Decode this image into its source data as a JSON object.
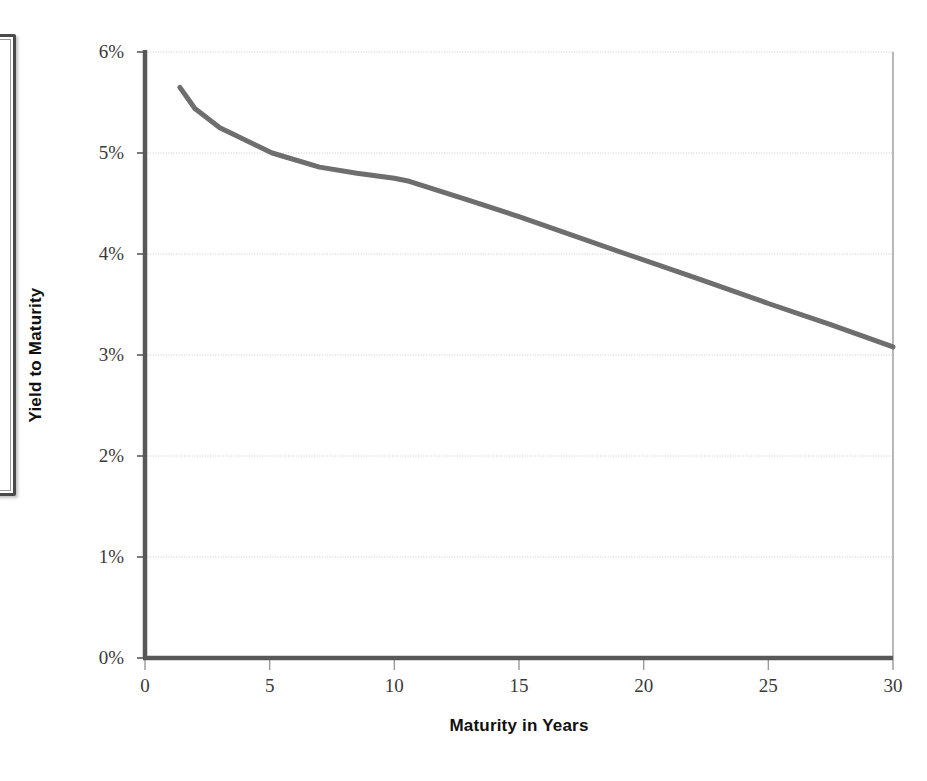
{
  "figure": {
    "kind": "line-chart",
    "background": "#ffffff"
  },
  "scan_artifact": {
    "name": "partial-bordered-box",
    "border_color": "#4a4a4a"
  },
  "axis_titles": {
    "y": "Yield to Maturity",
    "x": "Maturity in Years"
  },
  "ticks": {
    "y_labels": [
      "6%",
      "5%",
      "4%",
      "3%",
      "2%",
      "1%",
      "0%"
    ],
    "x_labels": [
      "0",
      "5",
      "10",
      "15",
      "20",
      "25",
      "30"
    ]
  },
  "colors": {
    "series_line": "#6e6e6e",
    "axis_line": "#585858",
    "gridline": "#c9c9c9",
    "plot_border": "#9a9a9a",
    "tick_text": "#3a3a3a",
    "title_text": "#111111"
  },
  "chart_data": {
    "type": "line",
    "title": "",
    "subtitle": "",
    "xlabel": "Maturity in Years",
    "ylabel": "Yield to Maturity",
    "xlim": [
      0,
      30
    ],
    "ylim": [
      0,
      6
    ],
    "xticks": [
      0,
      5,
      10,
      15,
      20,
      25,
      30
    ],
    "yticks": [
      0,
      1,
      2,
      3,
      4,
      5,
      6
    ],
    "ytick_format": "percent",
    "grid": {
      "horizontal": true,
      "vertical": false,
      "style": "dotted"
    },
    "legend": {
      "visible": false,
      "position": "none"
    },
    "series": [
      {
        "name": "Yield curve",
        "color": "#6e6e6e",
        "line_width": 5,
        "markers": false,
        "x": [
          1.4,
          2.0,
          3.0,
          3.5,
          5.1,
          7.0,
          8.5,
          10.0,
          10.6,
          13.0,
          15.0,
          19.3,
          22.0,
          25.0,
          27.5,
          30.0
        ],
        "y": [
          5.65,
          5.44,
          5.25,
          5.19,
          5.0,
          4.86,
          4.8,
          4.75,
          4.72,
          4.53,
          4.37,
          4.0,
          3.77,
          3.51,
          3.3,
          3.08
        ]
      }
    ]
  }
}
